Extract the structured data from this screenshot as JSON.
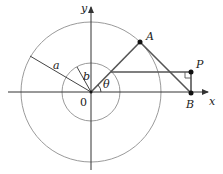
{
  "diagram": {
    "colors": {
      "axis": "#333333",
      "circle": "#9a9a9a",
      "line": "#555555",
      "point": "#111111"
    },
    "labels": {
      "y_axis": "y",
      "x_axis": "x",
      "origin": "0",
      "radius_a": "a",
      "radius_b": "b",
      "angle": "θ",
      "point_A": "A",
      "point_P": "P",
      "point_B": "B"
    },
    "geometry": {
      "origin": [
        91,
        92
      ],
      "inner_circle_radius": 29,
      "outer_circle_radius": 70,
      "point_A": [
        140,
        42
      ],
      "point_P": [
        191,
        72
      ],
      "point_B": [
        191,
        93
      ],
      "right_angle_marker_at": "P"
    }
  }
}
